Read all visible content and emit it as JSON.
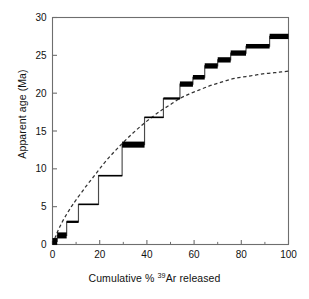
{
  "chart_data": {
    "type": "line",
    "title": "",
    "xlabel": "Cumulative % 39Ar released",
    "xlabel_prefix": "Cumulative % ",
    "xlabel_superscript": "39",
    "xlabel_suffix": "Ar released",
    "ylabel": "Apparent age (Ma)",
    "xlim": [
      0,
      100
    ],
    "ylim": [
      0,
      30
    ],
    "xticks": [
      0,
      20,
      40,
      60,
      80,
      100
    ],
    "xtick_labels": [
      "0",
      "20",
      "40",
      "60",
      "80",
      "100"
    ],
    "yticks": [
      0,
      5,
      10,
      15,
      20,
      25,
      30
    ],
    "ytick_labels": [
      "0",
      "5",
      "10",
      "15",
      "20",
      "25",
      "30"
    ],
    "xminor_ticks": [
      10,
      30,
      50,
      70,
      90
    ],
    "grid": false,
    "legend": null,
    "frame": "full-box",
    "tick_direction": "in",
    "colors": {
      "axis": "#6e6e6e",
      "staircase": "#4a4a4a",
      "error_bar": "#000000",
      "model_curve": "#333333",
      "background": "#ffffff"
    },
    "series": [
      {
        "name": "Age spectrum staircase",
        "type": "step",
        "style": "solid",
        "steps": [
          {
            "x_start": 0.0,
            "x_end": 2.0,
            "age": 0.4,
            "error_plus": 0.45,
            "error_minus": 0.45
          },
          {
            "x_start": 2.0,
            "x_end": 6.0,
            "age": 1.2,
            "error_plus": 0.4,
            "error_minus": 0.4
          },
          {
            "x_start": 6.0,
            "x_end": 11.0,
            "age": 3.0,
            "error_plus": 0.15,
            "error_minus": 0.15
          },
          {
            "x_start": 11.0,
            "x_end": 19.5,
            "age": 5.3,
            "error_plus": 0.1,
            "error_minus": 0.1
          },
          {
            "x_start": 19.5,
            "x_end": 29.5,
            "age": 9.1,
            "error_plus": 0.1,
            "error_minus": 0.1
          },
          {
            "x_start": 29.5,
            "x_end": 39.0,
            "age": 13.2,
            "error_plus": 0.4,
            "error_minus": 0.4
          },
          {
            "x_start": 39.0,
            "x_end": 47.0,
            "age": 16.8,
            "error_plus": 0.1,
            "error_minus": 0.1
          },
          {
            "x_start": 47.0,
            "x_end": 54.0,
            "age": 19.3,
            "error_plus": 0.15,
            "error_minus": 0.15
          },
          {
            "x_start": 54.0,
            "x_end": 59.5,
            "age": 21.2,
            "error_plus": 0.35,
            "error_minus": 0.35
          },
          {
            "x_start": 59.5,
            "x_end": 64.5,
            "age": 22.1,
            "error_plus": 0.3,
            "error_minus": 0.3
          },
          {
            "x_start": 64.5,
            "x_end": 70.0,
            "age": 23.6,
            "error_plus": 0.35,
            "error_minus": 0.35
          },
          {
            "x_start": 70.0,
            "x_end": 75.5,
            "age": 24.4,
            "error_plus": 0.35,
            "error_minus": 0.35
          },
          {
            "x_start": 75.5,
            "x_end": 82.0,
            "age": 25.3,
            "error_plus": 0.35,
            "error_minus": 0.35
          },
          {
            "x_start": 82.0,
            "x_end": 92.0,
            "age": 26.2,
            "error_plus": 0.3,
            "error_minus": 0.3
          },
          {
            "x_start": 92.0,
            "x_end": 100.0,
            "age": 27.5,
            "error_plus": 0.35,
            "error_minus": 0.35
          }
        ]
      },
      {
        "name": "Model diffusion curve",
        "type": "line",
        "style": "dashed",
        "points": [
          {
            "x": 0,
            "y": 0.0
          },
          {
            "x": 2,
            "y": 1.6
          },
          {
            "x": 4,
            "y": 2.9
          },
          {
            "x": 6,
            "y": 4.0
          },
          {
            "x": 8,
            "y": 5.0
          },
          {
            "x": 10,
            "y": 5.9
          },
          {
            "x": 14,
            "y": 7.6
          },
          {
            "x": 18,
            "y": 9.2
          },
          {
            "x": 22,
            "y": 10.8
          },
          {
            "x": 26,
            "y": 12.2
          },
          {
            "x": 30,
            "y": 13.5
          },
          {
            "x": 34,
            "y": 14.7
          },
          {
            "x": 38,
            "y": 15.8
          },
          {
            "x": 42,
            "y": 16.8
          },
          {
            "x": 46,
            "y": 17.7
          },
          {
            "x": 50,
            "y": 18.5
          },
          {
            "x": 54,
            "y": 19.3
          },
          {
            "x": 58,
            "y": 19.9
          },
          {
            "x": 62,
            "y": 20.4
          },
          {
            "x": 66,
            "y": 20.9
          },
          {
            "x": 70,
            "y": 21.3
          },
          {
            "x": 74,
            "y": 21.7
          },
          {
            "x": 78,
            "y": 22.0
          },
          {
            "x": 82,
            "y": 22.2
          },
          {
            "x": 86,
            "y": 22.4
          },
          {
            "x": 90,
            "y": 22.6
          },
          {
            "x": 94,
            "y": 22.7
          },
          {
            "x": 97,
            "y": 22.8
          },
          {
            "x": 100,
            "y": 22.9
          }
        ]
      }
    ]
  }
}
